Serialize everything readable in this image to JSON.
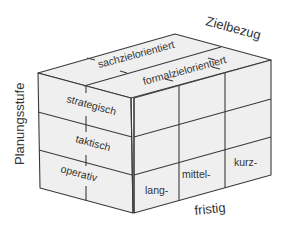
{
  "diagram": {
    "type": "3d-cube-matrix",
    "axes": {
      "vertical": {
        "label": "Planungsstufe"
      },
      "depth": {
        "label": "Zielbezug"
      },
      "horizontal": {
        "label": "fristig"
      }
    },
    "planning_levels": [
      {
        "label": "strategisch"
      },
      {
        "label": "taktisch"
      },
      {
        "label": "operativ"
      }
    ],
    "goal_reference": [
      {
        "label": "sachzielorientiert"
      },
      {
        "label": "formalzielorientiert"
      }
    ],
    "time_horizon": [
      {
        "label": "lang-"
      },
      {
        "label": "mittel-"
      },
      {
        "label": "kurz-"
      }
    ],
    "colors": {
      "face_fill": "#efefef",
      "line": "#3a3a3a",
      "text": "#333333"
    }
  }
}
